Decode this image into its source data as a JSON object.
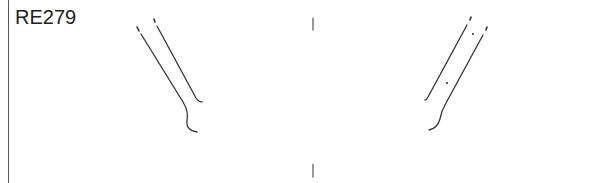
{
  "figure": {
    "label": "RE279",
    "colors": {
      "stroke": "#333333",
      "border": "#555555",
      "background": "#ffffff"
    },
    "left_shape": {
      "name": "left-prong-outline",
      "lines": [
        {
          "from": [
            137,
            27
          ],
          "to": [
            183,
            102
          ],
          "then_curve_to": [
            195,
            131
          ]
        },
        {
          "from": [
            154,
            19
          ],
          "to": [
            198,
            101
          ]
        }
      ]
    },
    "right_shape": {
      "name": "right-prong-outline",
      "lines": [
        {
          "from": [
            471,
            17
          ],
          "to": [
            426,
            100
          ]
        },
        {
          "from": [
            487,
            27
          ],
          "to": [
            445,
            103
          ],
          "then_curve_to": [
            430,
            130
          ]
        }
      ],
      "dots": [
        [
          473,
          34
        ],
        [
          447,
          83
        ]
      ]
    },
    "center_marks": [
      {
        "x": 313,
        "y1": 18,
        "y2": 30
      },
      {
        "x": 313,
        "y1": 164,
        "y2": 177
      }
    ]
  }
}
